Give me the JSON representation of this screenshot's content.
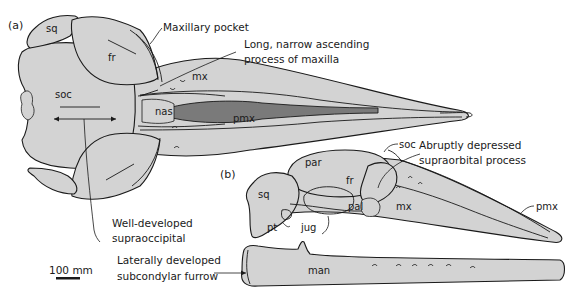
{
  "figure": {
    "panels": [
      {
        "id": "a",
        "label": "(a)",
        "view": "dorsal view of skull"
      },
      {
        "id": "b",
        "label": "(b)",
        "view": "lateral view of skull and mandible"
      }
    ],
    "panel_a": {
      "label": "(a)",
      "bone_labels": {
        "sq": "sq",
        "fr": "fr",
        "soc": "soc",
        "mx": "mx",
        "nas": "nas",
        "pmx": "pmx"
      },
      "annotations": {
        "maxillary_pocket": "Maxillary pocket",
        "ascending_process_line1": "Long, narrow ascending",
        "ascending_process_line2": "process of maxilla",
        "supraoccipital_line1": "Well-developed",
        "supraoccipital_line2": "supraoccipital"
      }
    },
    "panel_b": {
      "label": "(b)",
      "bone_labels": {
        "soc": "soc",
        "par": "par",
        "sq": "sq",
        "fr": "fr",
        "pal": "pal",
        "mx": "mx",
        "pmx": "pmx",
        "pt": "pt",
        "jug": "jug",
        "man": "man"
      },
      "annotations": {
        "supraorbital_line1": "Abruptly depressed",
        "supraorbital_line2": "supraorbital process",
        "subcondylar_line1": "Laterally developed",
        "subcondylar_line2": "subcondylar furrow"
      }
    },
    "scale_bar": {
      "label": "100 mm"
    },
    "colors": {
      "bone_fill": "#d3d3d3",
      "nasal_cavity_fill": "#7a7a7a",
      "outline": "#1a1a1a",
      "background": "#ffffff"
    }
  }
}
